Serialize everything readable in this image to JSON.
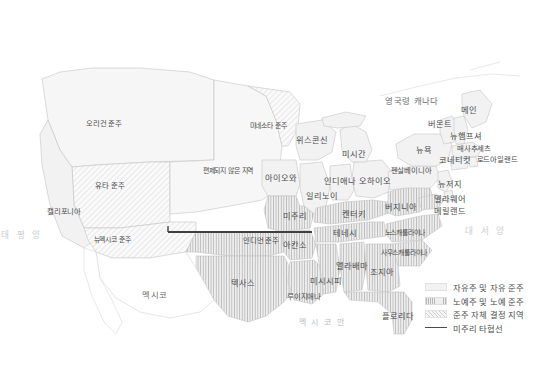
{
  "map": {
    "title_hidden": "",
    "background_color": "#ffffff",
    "outline_color": "#c8c8c8",
    "free_fill": "#f2f2f2",
    "slave_fill": "#e9e9e9",
    "territory_fill": "#f7f7f7",
    "compromise_line_color": "#3f3f3f",
    "label_color": "#4a4a4a",
    "ocean_label_color": "#c9cdd1"
  },
  "countries": [
    {
      "name": "british-canada",
      "label": "영국령 캐나다",
      "x": 412,
      "y": 101
    },
    {
      "name": "mexico",
      "label": "멕시코",
      "x": 155,
      "y": 295
    }
  ],
  "oceans": [
    {
      "name": "pacific-ocean",
      "label": "태 평 양",
      "x": 22,
      "y": 235
    },
    {
      "name": "atlantic-ocean",
      "label": "대 서 양",
      "x": 486,
      "y": 231
    },
    {
      "name": "gulf-of-mexico",
      "label": "멕 시 코 만",
      "x": 322,
      "y": 323
    }
  ],
  "regions": [
    {
      "name": "oregon-territory",
      "label": "오리건 준주",
      "x": 104,
      "y": 124,
      "type": "territory"
    },
    {
      "name": "utah-territory",
      "label": "유타 준주",
      "x": 110,
      "y": 186,
      "type": "territory"
    },
    {
      "name": "california",
      "label": "캘리포니아",
      "x": 64,
      "y": 212,
      "type": "free"
    },
    {
      "name": "new-mexico-territory",
      "label": "뉴멕시코 준주",
      "x": 112,
      "y": 240,
      "type": "territory"
    },
    {
      "name": "minnesota-territory",
      "label": "미네소타 준주",
      "x": 268,
      "y": 126,
      "type": "territory"
    },
    {
      "name": "unorganized-territory",
      "label": "편제되지 않은 지역",
      "x": 228,
      "y": 171,
      "type": "territory"
    },
    {
      "name": "indian-territory",
      "label": "인디언 준주",
      "x": 261,
      "y": 241,
      "type": "territory"
    },
    {
      "name": "texas",
      "label": "텍사스",
      "x": 243,
      "y": 283,
      "type": "slave"
    },
    {
      "name": "iowa",
      "label": "아이오와",
      "x": 281,
      "y": 178,
      "type": "free"
    },
    {
      "name": "missouri",
      "label": "미주리",
      "x": 295,
      "y": 216,
      "type": "slave"
    },
    {
      "name": "arkansas",
      "label": "아칸소",
      "x": 295,
      "y": 245,
      "type": "slave"
    },
    {
      "name": "louisiana",
      "label": "루이지애나",
      "x": 304,
      "y": 297,
      "type": "slave"
    },
    {
      "name": "mississippi",
      "label": "미시시피",
      "x": 326,
      "y": 281,
      "type": "slave"
    },
    {
      "name": "alabama",
      "label": "앨라배마",
      "x": 352,
      "y": 266,
      "type": "slave"
    },
    {
      "name": "tennessee",
      "label": "테네시",
      "x": 345,
      "y": 233,
      "type": "slave"
    },
    {
      "name": "kentucky",
      "label": "켄터키",
      "x": 354,
      "y": 214,
      "type": "slave"
    },
    {
      "name": "illinois",
      "label": "일리노이",
      "x": 322,
      "y": 196,
      "type": "free"
    },
    {
      "name": "indiana",
      "label": "인디애나",
      "x": 340,
      "y": 181,
      "type": "free"
    },
    {
      "name": "ohio",
      "label": "오하이오",
      "x": 375,
      "y": 181,
      "type": "free"
    },
    {
      "name": "michigan",
      "label": "미시간",
      "x": 354,
      "y": 154,
      "type": "free"
    },
    {
      "name": "wisconsin",
      "label": "위스콘신",
      "x": 312,
      "y": 140,
      "type": "free"
    },
    {
      "name": "georgia",
      "label": "조지아",
      "x": 382,
      "y": 272,
      "type": "slave"
    },
    {
      "name": "florida",
      "label": "플로리다",
      "x": 398,
      "y": 316,
      "type": "slave"
    },
    {
      "name": "south-carolina",
      "label": "사우스캐롤라이나",
      "x": 404,
      "y": 253,
      "type": "slave"
    },
    {
      "name": "north-carolina",
      "label": "노스캐롤라이나",
      "x": 405,
      "y": 233,
      "type": "slave"
    },
    {
      "name": "virginia",
      "label": "버지니아",
      "x": 401,
      "y": 207,
      "type": "slave"
    },
    {
      "name": "pennsylvania",
      "label": "펜실베이니아",
      "x": 411,
      "y": 171,
      "type": "free"
    },
    {
      "name": "new-york",
      "label": "뉴욕",
      "x": 424,
      "y": 150,
      "type": "free"
    },
    {
      "name": "vermont",
      "label": "버몬트",
      "x": 440,
      "y": 124,
      "type": "free"
    },
    {
      "name": "maine",
      "label": "메인",
      "x": 469,
      "y": 110,
      "type": "free"
    },
    {
      "name": "new-hampshire",
      "label": "뉴햄프셔",
      "x": 466,
      "y": 136,
      "type": "free"
    },
    {
      "name": "massachusetts",
      "label": "매사추세츠",
      "x": 474,
      "y": 149,
      "type": "free"
    },
    {
      "name": "connecticut",
      "label": "코네티컷",
      "x": 455,
      "y": 160,
      "type": "free"
    },
    {
      "name": "rhode-island",
      "label": "로드아일랜드",
      "x": 497,
      "y": 160,
      "type": "free"
    },
    {
      "name": "new-jersey",
      "label": "뉴저지",
      "x": 450,
      "y": 184,
      "type": "free"
    },
    {
      "name": "delaware",
      "label": "델라웨어",
      "x": 450,
      "y": 199,
      "type": "free"
    },
    {
      "name": "maryland",
      "label": "메릴랜드",
      "x": 450,
      "y": 211,
      "type": "slave"
    }
  ],
  "legend": {
    "items": [
      {
        "name": "legend-free-states",
        "label": "자유주 및 자유 준주",
        "swatch": "free"
      },
      {
        "name": "legend-slave-states",
        "label": "노예주 및 노예 준주",
        "swatch": "slave"
      },
      {
        "name": "legend-popular-sovereignty",
        "label": "준주 자체 결정 지역",
        "swatch": "terr"
      },
      {
        "name": "legend-compromise-line",
        "label": "미주리 타협선",
        "swatch": "line"
      }
    ]
  }
}
